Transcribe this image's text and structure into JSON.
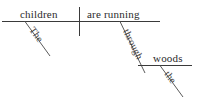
{
  "diagram": {
    "type": "reed-kellogg-sentence-diagram",
    "sentence": "The children are running through the woods.",
    "colors": {
      "background": "#ffffff",
      "line": "#3a3a3a",
      "line_diagonal": "#5a5a5a",
      "text": "#2b2b2b",
      "text_modifier": "#3d3d3d"
    },
    "words": {
      "subject": "children",
      "subject_article": "The",
      "predicate": "are running",
      "preposition": "through",
      "object_of_preposition": "woods",
      "object_article": "the"
    },
    "parts": {
      "subject_label": "subject",
      "predicate_label": "predicate",
      "article_label": "article",
      "preposition_label": "preposition",
      "object_label": "object of preposition"
    }
  }
}
